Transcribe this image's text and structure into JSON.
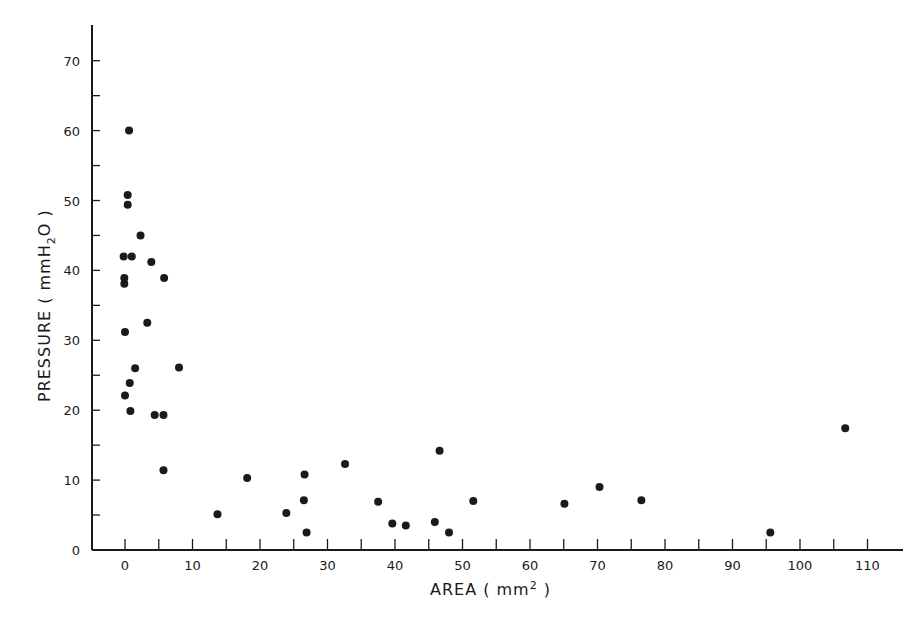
{
  "chart_data": {
    "type": "scatter",
    "title": "",
    "xlabel": "AREA (mm2)",
    "ylabel": "PRESSURE (mmH2O)",
    "xlabel_parts": {
      "main": "AREA ( mm",
      "sup": "2",
      "end": " )"
    },
    "ylabel_parts": {
      "main": "PRESSURE ( mmH",
      "sub": "2",
      "end": "O )"
    },
    "xlim": [
      -5,
      115
    ],
    "ylim": [
      0,
      75
    ],
    "x_ticks": [
      0,
      10,
      20,
      30,
      40,
      50,
      60,
      70,
      80,
      90,
      100,
      110
    ],
    "x_tick_labels": [
      "0",
      "10",
      "20",
      "30",
      "40",
      "50",
      "60",
      "70",
      "80",
      "90",
      "100",
      "110"
    ],
    "x_minor_ticks": [
      5,
      15,
      25,
      35,
      45,
      55,
      65,
      75,
      85,
      95,
      105
    ],
    "y_ticks": [
      0,
      10,
      20,
      30,
      40,
      50,
      60,
      70
    ],
    "y_tick_labels": [
      "0",
      "10",
      "20",
      "30",
      "40",
      "50",
      "60",
      "70"
    ],
    "y_minor_ticks": [
      5,
      15,
      25,
      35,
      45,
      55,
      65
    ],
    "grid": false,
    "legend": null,
    "marker_color": "#1a1a1a",
    "series": [
      {
        "name": "observations",
        "points": [
          {
            "x": 0.6,
            "y": 60.0
          },
          {
            "x": 0.4,
            "y": 50.8
          },
          {
            "x": 0.4,
            "y": 49.4
          },
          {
            "x": 2.3,
            "y": 45.0
          },
          {
            "x": -0.2,
            "y": 42.0
          },
          {
            "x": 1.0,
            "y": 42.0
          },
          {
            "x": 3.9,
            "y": 41.2
          },
          {
            "x": -0.1,
            "y": 38.9
          },
          {
            "x": -0.1,
            "y": 38.1
          },
          {
            "x": 5.8,
            "y": 38.9
          },
          {
            "x": 3.3,
            "y": 32.5
          },
          {
            "x": 0.0,
            "y": 31.2
          },
          {
            "x": 1.5,
            "y": 26.0
          },
          {
            "x": 8.0,
            "y": 26.1
          },
          {
            "x": 0.7,
            "y": 23.9
          },
          {
            "x": 0.0,
            "y": 22.1
          },
          {
            "x": 0.8,
            "y": 19.9
          },
          {
            "x": 4.4,
            "y": 19.3
          },
          {
            "x": 5.7,
            "y": 19.3
          },
          {
            "x": 5.7,
            "y": 11.4
          },
          {
            "x": 13.7,
            "y": 5.1
          },
          {
            "x": 18.1,
            "y": 10.3
          },
          {
            "x": 23.9,
            "y": 5.3
          },
          {
            "x": 26.6,
            "y": 10.8
          },
          {
            "x": 26.5,
            "y": 7.1
          },
          {
            "x": 26.9,
            "y": 2.5
          },
          {
            "x": 32.6,
            "y": 12.3
          },
          {
            "x": 37.5,
            "y": 6.9
          },
          {
            "x": 39.6,
            "y": 3.8
          },
          {
            "x": 41.6,
            "y": 3.5
          },
          {
            "x": 46.6,
            "y": 14.2
          },
          {
            "x": 45.9,
            "y": 4.0
          },
          {
            "x": 48.0,
            "y": 2.5
          },
          {
            "x": 51.6,
            "y": 7.0
          },
          {
            "x": 65.1,
            "y": 6.6
          },
          {
            "x": 70.3,
            "y": 9.0
          },
          {
            "x": 76.5,
            "y": 7.1
          },
          {
            "x": 95.6,
            "y": 2.5
          },
          {
            "x": 106.7,
            "y": 17.4
          }
        ]
      }
    ]
  }
}
